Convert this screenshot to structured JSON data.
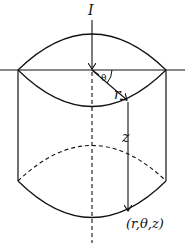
{
  "diagram": {
    "labels": {
      "current": "I",
      "angle": "θ",
      "radius": "r",
      "height": "z",
      "point": "(r,θ,z)"
    },
    "colors": {
      "line": "#111111",
      "background": "#ffffff"
    }
  }
}
